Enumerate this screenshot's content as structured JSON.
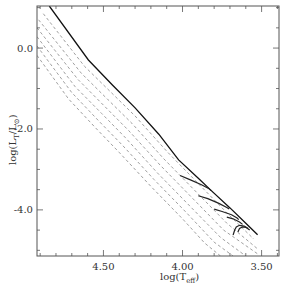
{
  "chart_data": {
    "type": "line",
    "title": "",
    "xlabel": "log(T_eff)",
    "ylabel": "log(L_T/L_⊙)",
    "xlim": [
      4.92,
      3.39
    ],
    "ylim": [
      -5.14,
      1.04
    ],
    "x_inverted": true,
    "grid": false,
    "legend": null,
    "x_ticks": [
      {
        "value": 4.5,
        "label": "4.50"
      },
      {
        "value": 4.0,
        "label": "4.00"
      },
      {
        "value": 3.5,
        "label": "3.50"
      }
    ],
    "y_ticks": [
      {
        "value": 0.0,
        "label": "0.0"
      },
      {
        "value": -2.0,
        "label": "-2.0"
      },
      {
        "value": -4.0,
        "label": "-4.0"
      }
    ],
    "x_minor_step": 0.1,
    "y_minor_step": 0.5,
    "series": [
      {
        "name": "solid",
        "style": "solid",
        "x": [
          4.842,
          4.595,
          4.443,
          4.3,
          4.15,
          4.025,
          3.9,
          3.823,
          3.7,
          3.6,
          3.525
        ],
        "y": [
          1.04,
          -0.296,
          -0.914,
          -1.48,
          -2.13,
          -2.765,
          -3.22,
          -3.506,
          -3.95,
          -4.33,
          -4.617
        ]
      },
      {
        "name": "dashed-1",
        "style": "dashed",
        "x": [
          4.88,
          4.62,
          4.45,
          4.3,
          4.1,
          3.9,
          3.7,
          3.55
        ],
        "y": [
          0.85,
          -0.45,
          -1.1,
          -1.68,
          -2.55,
          -3.35,
          -4.15,
          -4.72
        ]
      },
      {
        "name": "dashed-2",
        "style": "dashed",
        "x": [
          4.91,
          4.64,
          4.47,
          4.32,
          4.12,
          3.92,
          3.72,
          3.53
        ],
        "y": [
          0.7,
          -0.62,
          -1.28,
          -1.86,
          -2.73,
          -3.53,
          -4.33,
          -4.95
        ]
      },
      {
        "name": "dashed-3",
        "style": "dashed",
        "x": [
          4.92,
          4.66,
          4.49,
          4.34,
          4.14,
          3.94,
          3.74,
          3.52
        ],
        "y": [
          0.5,
          -0.78,
          -1.45,
          -2.04,
          -2.9,
          -3.7,
          -4.5,
          -5.1
        ]
      },
      {
        "name": "dashed-4",
        "style": "dashed",
        "x": [
          4.92,
          4.68,
          4.51,
          4.36,
          4.16,
          3.96,
          3.76,
          3.6
        ],
        "y": [
          0.28,
          -0.95,
          -1.62,
          -2.22,
          -3.08,
          -3.88,
          -4.68,
          -5.14
        ]
      },
      {
        "name": "dashed-5",
        "style": "dashed",
        "x": [
          4.92,
          4.7,
          4.53,
          4.38,
          4.18,
          3.98,
          3.8,
          3.68
        ],
        "y": [
          0.05,
          -1.1,
          -1.8,
          -2.4,
          -3.25,
          -4.05,
          -4.8,
          -5.14
        ]
      },
      {
        "name": "dashed-6",
        "style": "dashed",
        "x": [
          4.92,
          4.72,
          4.55,
          4.4,
          4.2,
          4.0,
          3.86,
          3.76
        ],
        "y": [
          -0.18,
          -1.26,
          -1.97,
          -2.58,
          -3.42,
          -4.22,
          -4.82,
          -5.14
        ]
      },
      {
        "name": "track-1",
        "style": "track",
        "x": [
          4.015,
          3.95,
          3.88,
          3.835,
          3.82
        ],
        "y": [
          -3.15,
          -3.26,
          -3.38,
          -3.47,
          -3.52
        ]
      },
      {
        "name": "track-2",
        "style": "track",
        "x": [
          3.9,
          3.84,
          3.77,
          3.72,
          3.705
        ],
        "y": [
          -3.65,
          -3.72,
          -3.84,
          -3.94,
          -3.98
        ]
      },
      {
        "name": "track-3",
        "style": "track",
        "x": [
          3.8,
          3.75,
          3.69,
          3.655,
          3.645
        ],
        "y": [
          -3.98,
          -4.04,
          -4.12,
          -4.2,
          -4.24
        ]
      },
      {
        "name": "track-4",
        "style": "track",
        "x": [
          3.72,
          3.68,
          3.64,
          3.62
        ],
        "y": [
          -4.18,
          -4.22,
          -4.3,
          -4.36
        ]
      },
      {
        "name": "track-5",
        "style": "track",
        "x": [
          3.68,
          3.67,
          3.66,
          3.64,
          3.61,
          3.585
        ],
        "y": [
          -4.62,
          -4.5,
          -4.42,
          -4.38,
          -4.4,
          -4.46
        ]
      },
      {
        "name": "track-6",
        "style": "track",
        "x": [
          3.65,
          3.64,
          3.62,
          3.6,
          3.575
        ],
        "y": [
          -4.55,
          -4.46,
          -4.42,
          -4.43,
          -4.5
        ]
      }
    ]
  }
}
